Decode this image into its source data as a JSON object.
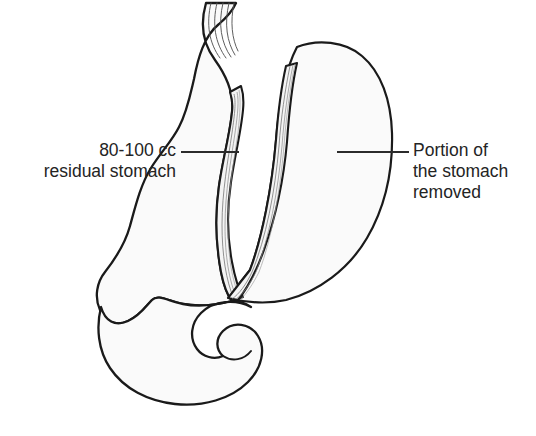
{
  "figure": {
    "type": "medical-line-illustration",
    "background_color": "#ffffff",
    "ink_color": "#1a1a1a",
    "organ_fill_color": "#fafafa",
    "staple_fill_color": "#f2f2f2"
  },
  "labels": {
    "left": {
      "name": "residual-stomach-label",
      "line1": "80-100 cc",
      "line2": "residual stomach",
      "leader": {
        "x1": 181,
        "y1": 152,
        "x2": 239,
        "y2": 152
      }
    },
    "right": {
      "name": "removed-portion-label",
      "line1": "Portion of",
      "line2": "the stomach",
      "line3": "removed",
      "leader": {
        "x1": 337,
        "y1": 152,
        "x2": 409,
        "y2": 152
      }
    }
  },
  "anatomy": {
    "esophagus": {
      "name": "esophagus",
      "striation_count": 5
    },
    "residual_sleeve": {
      "name": "residual-gastric-sleeve",
      "description": "narrow tubular remnant along lesser curvature"
    },
    "staple_lines": {
      "name": "staple-lines",
      "count": 2,
      "description": "two parallel hatched surgical staple lines"
    },
    "removed_portion": {
      "name": "removed-gastric-portion",
      "description": "fundus and greater curvature excised"
    },
    "antrum_duodenum": {
      "name": "antrum-and-duodenum",
      "description": "pyloric antrum continuing into C-shaped duodenum"
    }
  }
}
